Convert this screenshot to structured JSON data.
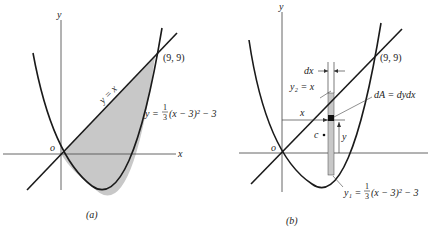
{
  "figure": {
    "panels": [
      {
        "id": "a",
        "caption": "(a)",
        "axis_x_label": "x",
        "axis_y_label": "y",
        "origin_label": "o",
        "point_label": "(9, 9)",
        "line_label": "y = x",
        "curve_label_prefix": "y = ",
        "curve_label_frac_num": "1",
        "curve_label_frac_den": "3",
        "curve_label_suffix": "(x − 3)² − 3"
      },
      {
        "id": "b",
        "caption": "(b)",
        "axis_y_label": "y",
        "origin_label": "o",
        "point_label": "(9, 9)",
        "dx_label": "dx",
        "y2_label": "y₂ = x",
        "dA_label": "dA = dydx",
        "x_dim_label": "x",
        "y_dim_label": "y",
        "centroid_label": "c",
        "y1_label_prefix": "y₁ = ",
        "y1_frac_num": "1",
        "y1_frac_den": "3",
        "y1_label_suffix": "(x − 3)² − 3"
      }
    ],
    "colors": {
      "stroke": "#1a1a1a",
      "shade": "#c8c8c8",
      "axis": "#555555"
    }
  }
}
